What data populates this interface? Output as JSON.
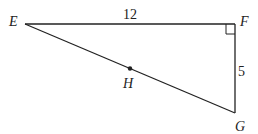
{
  "diagram": {
    "type": "right-triangle",
    "vertices": [
      {
        "name": "E",
        "label": "E"
      },
      {
        "name": "F",
        "label": "F"
      },
      {
        "name": "G",
        "label": "G"
      }
    ],
    "point_on_hypotenuse": {
      "name": "H",
      "label": "H"
    },
    "right_angle_at": "F",
    "side_labels": {
      "EF": "12",
      "FG": "5"
    },
    "colors": {
      "stroke": "#222222",
      "background": "#ffffff"
    }
  }
}
